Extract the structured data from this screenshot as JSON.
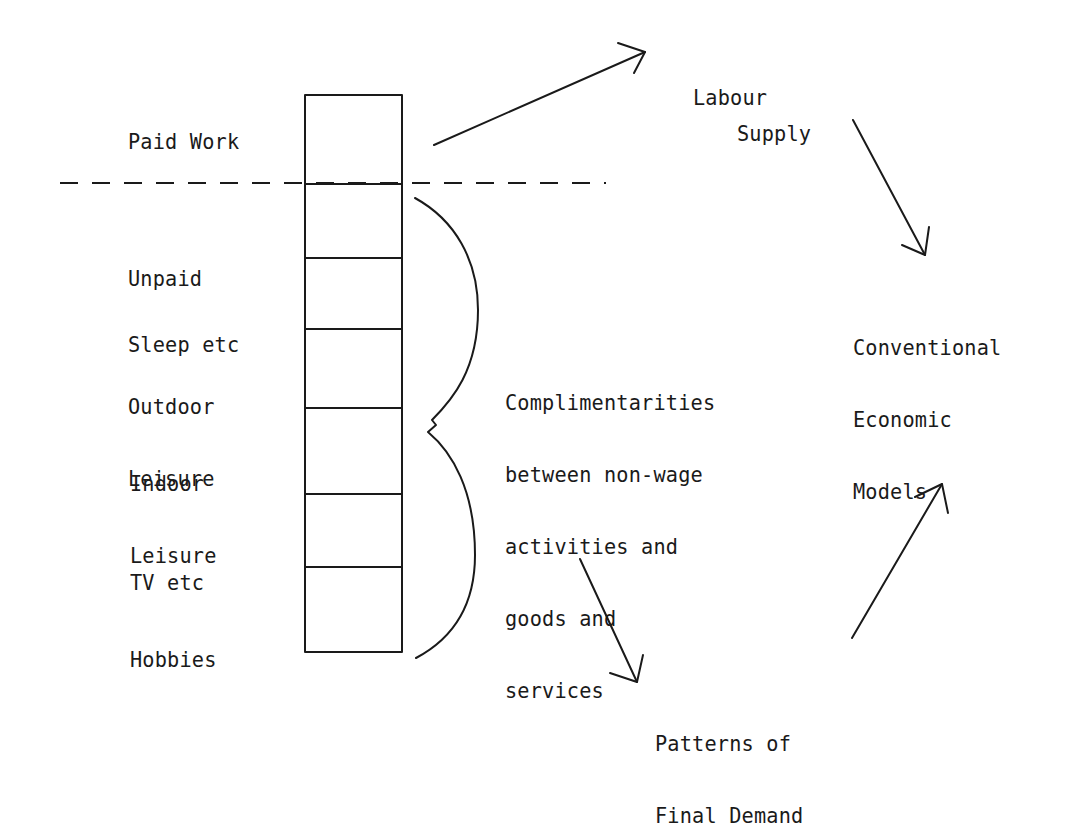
{
  "diagram": {
    "activities": {
      "paid": "Paid Work",
      "items": [
        {
          "lines": [
            "Unpaid"
          ]
        },
        {
          "lines": [
            "Sleep etc"
          ]
        },
        {
          "lines": [
            "Outdoor",
            "Leisure"
          ]
        },
        {
          "lines": [
            "Indoor",
            "Leisure"
          ]
        },
        {
          "lines": [
            "TV etc"
          ]
        },
        {
          "lines": [
            "Hobbies"
          ]
        }
      ]
    },
    "brace_label": {
      "lines": [
        "Complimentarities",
        "between non-wage",
        "activities and",
        "goods and",
        "services"
      ]
    },
    "nodes": {
      "labour_supply": {
        "lines": [
          "Labour",
          "Supply"
        ]
      },
      "conventional_models": {
        "lines": [
          "Conventional",
          "Economic",
          "Models"
        ]
      },
      "final_demand": {
        "lines": [
          "Patterns of",
          "Final Demand"
        ]
      }
    },
    "flows": [
      {
        "from": "Paid Work",
        "to": "Labour Supply"
      },
      {
        "from": "Labour Supply",
        "to": "Conventional Economic Models"
      },
      {
        "from": "Complimentarities between non-wage activities and goods and services",
        "to": "Patterns of Final Demand"
      },
      {
        "from": "Patterns of Final Demand",
        "to": "Conventional Economic Models"
      }
    ],
    "colors": {
      "ink": "#1a1a1a",
      "background": "#ffffff"
    }
  }
}
